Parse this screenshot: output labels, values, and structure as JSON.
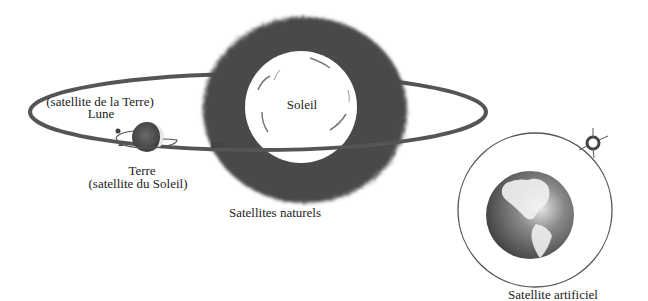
{
  "diagram": {
    "natural": {
      "caption": "Satellites naturels",
      "sun_label": "Soleil",
      "moon_label_line1": "(satellite de la Terre)",
      "moon_label_line2": "Lune",
      "earth_label_line1": "Terre",
      "earth_label_line2": "(satellite du Soleil)"
    },
    "artificial": {
      "caption": "Satellite artificiel"
    },
    "colors": {
      "orbit": "#555555",
      "halo": "#4a4a4a",
      "sun_disc": "#ffffff",
      "earth_dark": "#3a3a3a",
      "thin_orbit": "#666666"
    }
  }
}
